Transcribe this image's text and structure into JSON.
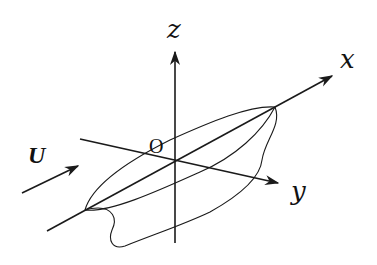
{
  "diagram": {
    "type": "3d-coordinate-sketch",
    "axes": {
      "x": {
        "label": "x"
      },
      "y": {
        "label": "y"
      },
      "z": {
        "label": "z"
      }
    },
    "origin_label": "O",
    "flow": {
      "label": "U",
      "direction": "along positive x"
    },
    "colors": {
      "stroke": "#1a1a1a",
      "background": "#ffffff"
    }
  }
}
